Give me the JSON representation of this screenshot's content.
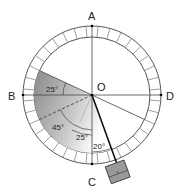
{
  "diagram": {
    "points": {
      "A": "A",
      "B": "B",
      "C": "C",
      "D": "D",
      "O": "O"
    },
    "angles": {
      "top_left": "25°",
      "mid_left": "45°",
      "center_low": "25°",
      "pointer": "20°"
    },
    "colors": {
      "line": "#333333",
      "shade_dark": "#8a8a8a",
      "shade_light": "#ffffff",
      "weight": "#9a9a9a"
    },
    "ring_ticks": 36
  }
}
